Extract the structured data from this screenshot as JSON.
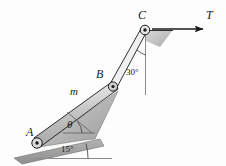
{
  "figure": {
    "labels": {
      "point_a": "A",
      "point_b": "B",
      "point_c": "C",
      "tension": "T",
      "mass": "m",
      "theta": "θ"
    },
    "angles": {
      "at_c": "30°",
      "incline": "15°"
    },
    "colors": {
      "bar_fill": "#c9c9c9",
      "bar_stroke": "#1a1a1a",
      "ground_fill": "#9a9a9a",
      "wedge_fill": "#a8a8a8",
      "line": "#1a1a1a",
      "reference_line": "#8a8a8a",
      "background": "#fdfdfd"
    },
    "geometry": {
      "pin_a": [
        37,
        143
      ],
      "pin_b": [
        113,
        87
      ],
      "pin_c": [
        145,
        30
      ],
      "arrow_start": [
        152,
        29
      ],
      "arrow_end": [
        204,
        29
      ],
      "vertical_from_c_end": [
        145,
        95
      ],
      "incline_left": [
        14,
        158
      ],
      "incline_right": [
        98,
        140
      ],
      "horizontal_ref_end": [
        112,
        158
      ]
    }
  }
}
